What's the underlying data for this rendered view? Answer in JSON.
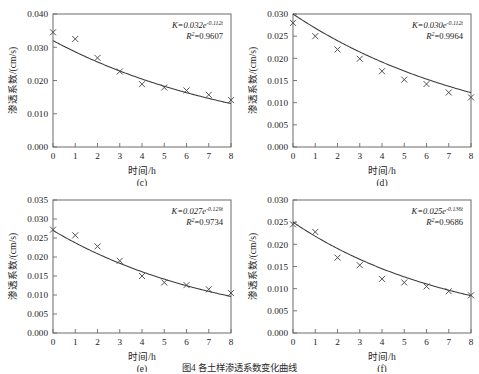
{
  "figure": {
    "caption": "图4  各土样渗透系数变化曲线",
    "axis": {
      "xlabel": "时间/h",
      "ylabel": "渗透系数/(cm/s)"
    }
  },
  "chart_data": [
    {
      "type": "scatter",
      "panel": "(c)",
      "title": "",
      "xlabel": "时间/h",
      "ylabel": "渗透系数/(cm/s)",
      "x": [
        0,
        1,
        2,
        3,
        4,
        5,
        6,
        7,
        8
      ],
      "values": [
        0.0345,
        0.0325,
        0.0268,
        0.0227,
        0.0189,
        0.0179,
        0.017,
        0.0157,
        0.0141
      ],
      "xlim": [
        0,
        8
      ],
      "ylim": [
        0.0,
        0.04
      ],
      "xticks": [
        0,
        1,
        2,
        3,
        4,
        5,
        6,
        7,
        8
      ],
      "yticks": [
        "0.000",
        "0.010",
        "0.020",
        "0.030",
        "0.040"
      ],
      "ytick_values": [
        0.0,
        0.01,
        0.02,
        0.03,
        0.04
      ],
      "grid": false,
      "legend": "none",
      "annotation_equation": "K=0.032e",
      "annotation_exponent": "-0.112t",
      "annotation_r2_label": "R",
      "annotation_r2_sup": "2",
      "annotation_r2_value": "=0.9607",
      "fit": {
        "a": 0.032,
        "b": 0.112,
        "r2": 0.9607
      }
    },
    {
      "type": "scatter",
      "panel": "(d)",
      "title": "",
      "xlabel": "时间/h",
      "ylabel": "渗透系数/(cm/s)",
      "x": [
        0,
        1,
        2,
        3,
        4,
        5,
        6,
        7,
        8
      ],
      "values": [
        0.028,
        0.025,
        0.022,
        0.0199,
        0.0171,
        0.0152,
        0.0142,
        0.0123,
        0.0112
      ],
      "xlim": [
        0,
        8
      ],
      "ylim": [
        0.0,
        0.03
      ],
      "xticks": [
        0,
        1,
        2,
        3,
        4,
        5,
        6,
        7,
        8
      ],
      "yticks": [
        "0.000",
        "0.005",
        "0.010",
        "0.015",
        "0.020",
        "0.025",
        "0.030"
      ],
      "ytick_values": [
        0.0,
        0.005,
        0.01,
        0.015,
        0.02,
        0.025,
        0.03
      ],
      "grid": false,
      "legend": "none",
      "annotation_equation": "K=0.030e",
      "annotation_exponent": "-0.112t",
      "annotation_r2_label": "R",
      "annotation_r2_sup": "2",
      "annotation_r2_value": "=0.9964",
      "fit": {
        "a": 0.03,
        "b": 0.112,
        "r2": 0.9964
      }
    },
    {
      "type": "scatter",
      "panel": "(e)",
      "title": "",
      "xlabel": "时间/h",
      "ylabel": "渗透系数/(cm/s)",
      "x": [
        0,
        1,
        2,
        3,
        4,
        5,
        6,
        7,
        8
      ],
      "values": [
        0.0272,
        0.0257,
        0.0228,
        0.019,
        0.015,
        0.0133,
        0.0126,
        0.0115,
        0.0105
      ],
      "xlim": [
        0,
        8
      ],
      "ylim": [
        0.0,
        0.035
      ],
      "xticks": [
        0,
        1,
        2,
        3,
        4,
        5,
        6,
        7,
        8
      ],
      "yticks": [
        "0.000",
        "0.005",
        "0.010",
        "0.015",
        "0.020",
        "0.025",
        "0.030",
        "0.035"
      ],
      "ytick_values": [
        0.0,
        0.005,
        0.01,
        0.015,
        0.02,
        0.025,
        0.03,
        0.035
      ],
      "grid": false,
      "legend": "none",
      "annotation_equation": "K=0.027e",
      "annotation_exponent": "-0.129t",
      "annotation_r2_label": "R",
      "annotation_r2_sup": "2",
      "annotation_r2_value": "=0.9734",
      "fit": {
        "a": 0.027,
        "b": 0.129,
        "r2": 0.9734
      }
    },
    {
      "type": "scatter",
      "panel": "(f)",
      "title": "",
      "xlabel": "时间/h",
      "ylabel": "渗透系数/(cm/s)",
      "x": [
        0,
        1,
        2,
        3,
        4,
        5,
        6,
        7,
        8
      ],
      "values": [
        0.0245,
        0.0228,
        0.017,
        0.0153,
        0.0122,
        0.0114,
        0.0105,
        0.0094,
        0.0085
      ],
      "xlim": [
        0,
        8
      ],
      "ylim": [
        0.0,
        0.03
      ],
      "xticks": [
        0,
        1,
        2,
        3,
        4,
        5,
        6,
        7,
        8
      ],
      "yticks": [
        "0.000",
        "0.005",
        "0.010",
        "0.015",
        "0.020",
        "0.025",
        "0.030"
      ],
      "ytick_values": [
        0.0,
        0.005,
        0.01,
        0.015,
        0.02,
        0.025,
        0.03
      ],
      "grid": false,
      "legend": "none",
      "annotation_equation": "K=0.025e",
      "annotation_exponent": "-0.136t",
      "annotation_r2_label": "R",
      "annotation_r2_sup": "2",
      "annotation_r2_value": "=0.9686",
      "fit": {
        "a": 0.025,
        "b": 0.136,
        "r2": 0.9686
      }
    }
  ]
}
